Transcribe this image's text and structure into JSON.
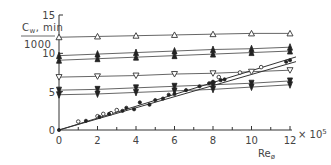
{
  "chart_data": {
    "type": "line",
    "title": "",
    "ylabel_top": "Cₘ,min",
    "ylabel_top_main": "C",
    "ylabel_top_sub": "w",
    "ylabel_top_rest": ", min",
    "ylabel_bottom": "1000",
    "xlabel_main": "Re",
    "xlabel_sub": "ø",
    "x_multiplier": "× 10",
    "x_multiplier_exp": "5",
    "xlim": [
      0,
      12
    ],
    "ylim": [
      0,
      15
    ],
    "x_ticks": [
      0,
      2,
      4,
      6,
      8,
      10,
      12
    ],
    "x_tick_labels": [
      "0",
      "2",
      "4",
      "6",
      "8",
      "10",
      "12"
    ],
    "x_minor_ticks": [
      1,
      3,
      5,
      7,
      9,
      11
    ],
    "y_ticks": [
      0,
      5,
      10,
      15
    ],
    "y_tick_labels": [
      "0",
      "5",
      "10",
      "15"
    ],
    "grid": false,
    "legend": "none",
    "series": [
      {
        "name": "open triangle up",
        "marker": "tri-up-open",
        "x": [
          0,
          2,
          4,
          6,
          8,
          10,
          12
        ],
        "y": [
          12.1,
          12.2,
          12.3,
          12.4,
          12.5,
          12.6,
          12.6
        ]
      },
      {
        "name": "filled upper A",
        "marker": "tri-filled",
        "x": [
          0,
          2,
          4,
          6,
          8,
          10,
          12
        ],
        "y": [
          9.7,
          9.9,
          10.1,
          10.3,
          10.5,
          10.6,
          10.8
        ]
      },
      {
        "name": "filled upper B",
        "marker": "tri-filled",
        "x": [
          0,
          2,
          4,
          6,
          8,
          10,
          12
        ],
        "y": [
          9.1,
          9.3,
          9.5,
          9.7,
          9.9,
          10.1,
          10.3
        ]
      },
      {
        "name": "open triangle down",
        "marker": "tri-down-open",
        "x": [
          0,
          2,
          4,
          6,
          8,
          10,
          12
        ],
        "y": [
          6.9,
          7.0,
          7.1,
          7.3,
          7.4,
          7.6,
          7.8
        ]
      },
      {
        "name": "filled lower A",
        "marker": "tri-down-filled",
        "x": [
          0,
          2,
          4,
          6,
          8,
          10,
          12
        ],
        "y": [
          5.2,
          5.3,
          5.5,
          5.7,
          5.9,
          6.1,
          6.4
        ]
      },
      {
        "name": "filled lower B",
        "marker": "tri-down-filled",
        "x": [
          0,
          2,
          4,
          6,
          8,
          10,
          12
        ],
        "y": [
          4.6,
          4.7,
          4.9,
          5.1,
          5.3,
          5.6,
          5.9
        ]
      }
    ],
    "regression_lines": [
      {
        "name": "fit upper",
        "x": [
          0,
          12
        ],
        "y": [
          0,
          9.3
        ]
      },
      {
        "name": "fit lower",
        "x": [
          0,
          12
        ],
        "y": [
          0,
          8.7
        ]
      }
    ],
    "scatter_open": {
      "name": "open circles",
      "x": [
        1.0,
        2.0,
        2.3,
        2.7,
        3.0,
        8.3,
        9.4,
        10.5
      ],
      "y": [
        1.1,
        1.8,
        2.1,
        2.2,
        2.6,
        6.9,
        7.5,
        8.2
      ]
    },
    "scatter_filled": {
      "name": "filled dots",
      "x": [
        0,
        1.4,
        2.1,
        2.6,
        3.3,
        3.5,
        3.9,
        4.2,
        4.7,
        5.0,
        5.4,
        5.7,
        6.0,
        6.6,
        7.3,
        7.8,
        8.0,
        8.4,
        8.6,
        11.8,
        12.0
      ],
      "y": [
        0,
        1.2,
        1.7,
        2.1,
        2.5,
        2.9,
        2.7,
        3.6,
        3.3,
        3.9,
        4.1,
        4.6,
        4.7,
        5.2,
        5.7,
        6.1,
        6.3,
        6.5,
        6.6,
        8.9,
        9.1
      ]
    }
  }
}
